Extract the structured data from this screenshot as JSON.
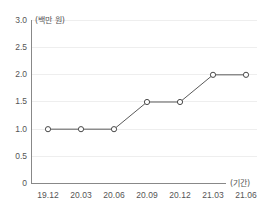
{
  "chart_data": {
    "type": "line",
    "title": "",
    "subtitle": "",
    "xlabel": "(기간)",
    "ylabel": "(백만 원)",
    "categories": [
      "19.12",
      "20.03",
      "20.06",
      "20.09",
      "20.12",
      "21.03",
      "21.06"
    ],
    "values": [
      1.0,
      1.0,
      1.0,
      1.5,
      1.5,
      2.0,
      2.0
    ],
    "series": [
      {
        "name": "",
        "values": [
          1.0,
          1.0,
          1.0,
          1.5,
          1.5,
          2.0,
          2.0
        ]
      }
    ],
    "ylim": [
      0,
      3.0
    ],
    "ytick_labels": [
      "3.0",
      "2.5",
      "2.0",
      "1.5",
      "1.0",
      "0.5",
      "0"
    ],
    "ytick_values": [
      3.0,
      2.5,
      2.0,
      1.5,
      1.0,
      0.5,
      0
    ],
    "grid": true,
    "grid_axis": "y",
    "legend": false,
    "legend_position": "none",
    "annotations": [],
    "colors": {
      "line": "#5a5a5a",
      "marker_fill": "#ffffff",
      "marker_stroke": "#4a4a4a",
      "gridline": "#eeeeee",
      "axis": "#888888",
      "text": "#555555",
      "background": "#ffffff"
    },
    "marker": "circle-open"
  },
  "axis_labels": {
    "y_unit": "(백만 원)",
    "x_unit": "(기간)"
  }
}
